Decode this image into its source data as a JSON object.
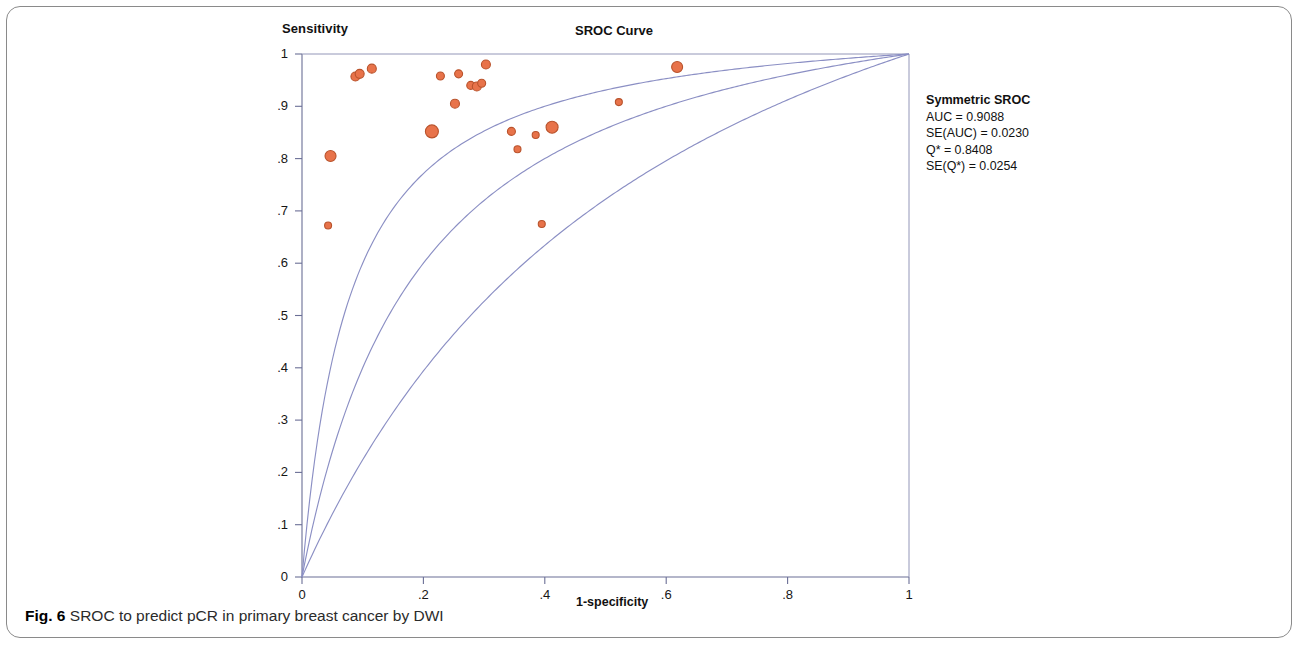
{
  "figure": {
    "caption_prefix": "Fig. 6",
    "caption_text": "SROC to predict pCR in primary breast cancer by DWI"
  },
  "stats": {
    "title": "Symmetric SROC",
    "auc": "AUC = 0.9088",
    "se_auc": "SE(AUC) = 0.0230",
    "q_star": "Q* = 0.8408",
    "se_q_star": "SE(Q*) = 0.0254"
  },
  "chart_data": {
    "type": "scatter",
    "title": "SROC Curve",
    "xlabel": "1-specificity",
    "ylabel": "Sensitivity",
    "xlim": [
      0,
      1
    ],
    "ylim": [
      0,
      1
    ],
    "grid": false,
    "legend_position": "right-outside",
    "xticks": [
      0,
      0.2,
      0.4,
      0.6,
      0.8,
      1
    ],
    "xtick_labels": [
      "0",
      ".2",
      ".4",
      ".6",
      ".8",
      "1"
    ],
    "yticks": [
      0,
      0.1,
      0.2,
      0.3,
      0.4,
      0.5,
      0.6,
      0.7,
      0.8,
      0.9,
      1
    ],
    "ytick_labels": [
      "0",
      ".1",
      ".2",
      ".3",
      ".4",
      ".5",
      ".6",
      ".7",
      ".8",
      ".9",
      "1"
    ],
    "marker_color": "#e8734a",
    "marker_edge_color": "#b9532c",
    "curve_color": "#8b8fc4",
    "series": [
      {
        "name": "Study estimates",
        "type": "scatter",
        "points": [
          {
            "x": 0.047,
            "y": 0.805,
            "size": 11
          },
          {
            "x": 0.043,
            "y": 0.672,
            "size": 7
          },
          {
            "x": 0.088,
            "y": 0.957,
            "size": 9
          },
          {
            "x": 0.095,
            "y": 0.962,
            "size": 9
          },
          {
            "x": 0.115,
            "y": 0.972,
            "size": 9
          },
          {
            "x": 0.214,
            "y": 0.852,
            "size": 13
          },
          {
            "x": 0.228,
            "y": 0.958,
            "size": 8
          },
          {
            "x": 0.252,
            "y": 0.905,
            "size": 9
          },
          {
            "x": 0.258,
            "y": 0.962,
            "size": 8
          },
          {
            "x": 0.278,
            "y": 0.94,
            "size": 8
          },
          {
            "x": 0.288,
            "y": 0.938,
            "size": 9
          },
          {
            "x": 0.296,
            "y": 0.944,
            "size": 8
          },
          {
            "x": 0.303,
            "y": 0.98,
            "size": 9
          },
          {
            "x": 0.345,
            "y": 0.852,
            "size": 8
          },
          {
            "x": 0.355,
            "y": 0.818,
            "size": 7
          },
          {
            "x": 0.385,
            "y": 0.845,
            "size": 7
          },
          {
            "x": 0.395,
            "y": 0.675,
            "size": 7
          },
          {
            "x": 0.412,
            "y": 0.86,
            "size": 12
          },
          {
            "x": 0.522,
            "y": 0.908,
            "size": 7
          },
          {
            "x": 0.618,
            "y": 0.975,
            "size": 11
          }
        ]
      },
      {
        "name": "SROC curve (upper)",
        "type": "line",
        "shape_parameter": 13.5
      },
      {
        "name": "SROC curve (fitted)",
        "type": "line",
        "shape_parameter": 6.0
      },
      {
        "name": "SROC curve (lower)",
        "type": "line",
        "shape_parameter": 2.6
      }
    ]
  }
}
